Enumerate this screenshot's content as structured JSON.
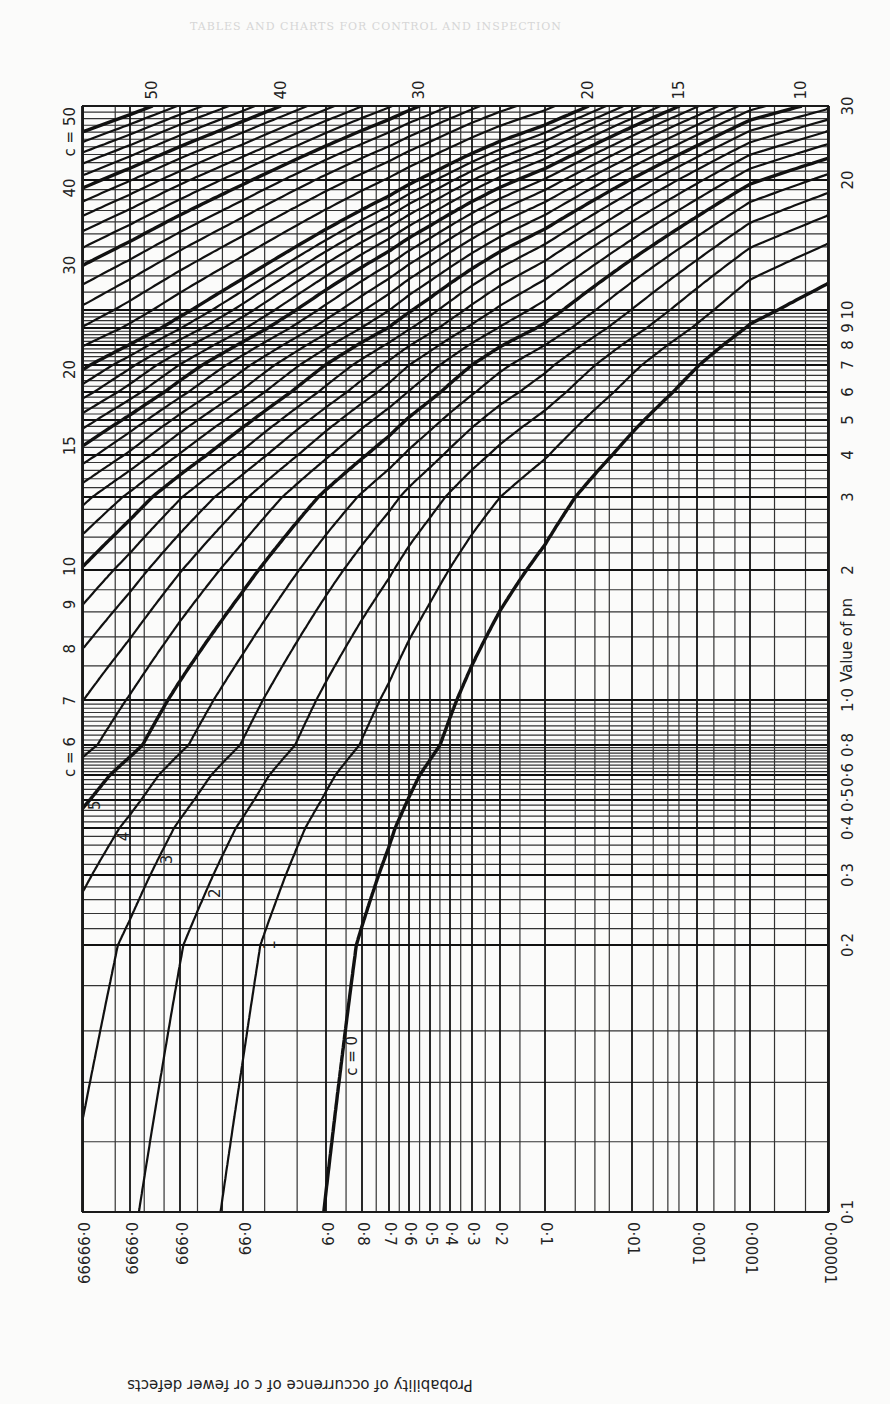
{
  "page": {
    "faint_header": "TABLES AND CHARTS FOR CONTROL AND INSPECTION"
  },
  "chart_data": {
    "type": "line",
    "title": "",
    "xlabel": "Value of pn",
    "ylabel": "Probability of occurrence of c or fewer defects",
    "orientation": "rotated 90 degrees clockwise (pn axis runs vertically along right edge, probability axis along bottom)",
    "x_scale": "log",
    "y_scale": "normal-probability",
    "xlim": [
      0.1,
      30
    ],
    "ylim": [
      1e-05,
      0.99999
    ],
    "grid": true,
    "x_ticks": [
      "0·1",
      "0·2",
      "0·3",
      "0·4",
      "0·5",
      "0·6",
      "0·8",
      "1·0",
      "2",
      "3",
      "4",
      "5",
      "6",
      "7",
      "8",
      "9",
      "10",
      "20",
      "30"
    ],
    "x_tick_values": [
      0.1,
      0.2,
      0.3,
      0.4,
      0.5,
      0.6,
      0.8,
      1.0,
      2,
      3,
      4,
      5,
      6,
      7,
      8,
      9,
      10,
      20,
      30
    ],
    "y_ticks": [
      "0·99999",
      "0·9999",
      "0·999",
      "0·99",
      "0·9",
      "0·8",
      "0·7",
      "0·6",
      "0·5",
      "0·4",
      "0·3",
      "0·2",
      "0·1",
      "0·01",
      "0·001",
      "0·0001",
      "0·00001"
    ],
    "y_tick_values": [
      0.99999,
      0.9999,
      0.999,
      0.99,
      0.9,
      0.8,
      0.7,
      0.6,
      0.5,
      0.4,
      0.3,
      0.2,
      0.1,
      0.01,
      0.001,
      0.0001,
      1e-05
    ],
    "series_description": "Cumulative Poisson probability P(X <= c) vs pn for each c",
    "series_c_values": [
      0,
      1,
      2,
      3,
      4,
      5,
      6,
      7,
      8,
      9,
      10,
      11,
      12,
      13,
      14,
      15,
      16,
      17,
      18,
      19,
      20,
      22,
      24,
      26,
      28,
      30,
      32,
      34,
      36,
      38,
      40,
      42,
      44,
      46,
      48,
      50
    ],
    "heavy_curves": [
      0,
      5,
      10,
      15,
      20,
      30,
      40,
      50
    ],
    "curve_labels_inside": [
      {
        "text": "c = 0",
        "c": 0
      },
      {
        "text": "1",
        "c": 1
      },
      {
        "text": "2",
        "c": 2
      },
      {
        "text": "3",
        "c": 3
      },
      {
        "text": "4",
        "c": 4
      },
      {
        "text": "5",
        "c": 5
      }
    ],
    "curve_labels_left_edge": [
      {
        "text": "c = 6",
        "c": 6
      },
      {
        "text": "7",
        "c": 7
      },
      {
        "text": "8",
        "c": 8
      },
      {
        "text": "9",
        "c": 9
      },
      {
        "text": "10",
        "c": 10
      },
      {
        "text": "15",
        "c": 15
      },
      {
        "text": "20",
        "c": 20
      },
      {
        "text": "30",
        "c": 30
      },
      {
        "text": "40",
        "c": 40
      },
      {
        "text": "c = 50",
        "c": 50
      }
    ],
    "curve_labels_top_edge": [
      {
        "text": "50",
        "c": 50
      },
      {
        "text": "40",
        "c": 40
      },
      {
        "text": "30",
        "c": 30
      },
      {
        "text": "20",
        "c": 20
      },
      {
        "text": "15",
        "c": 15
      },
      {
        "text": "10",
        "c": 10
      }
    ],
    "sample_points": [
      {
        "c": 0,
        "pn": 0.1,
        "p": 0.905
      },
      {
        "c": 0,
        "pn": 1.0,
        "p": 0.368
      },
      {
        "c": 0,
        "pn": 5,
        "p": 0.0067
      },
      {
        "c": 1,
        "pn": 1.0,
        "p": 0.736
      },
      {
        "c": 2,
        "pn": 1.0,
        "p": 0.92
      },
      {
        "c": 5,
        "pn": 5,
        "p": 0.616
      },
      {
        "c": 10,
        "pn": 10,
        "p": 0.583
      },
      {
        "c": 20,
        "pn": 20,
        "p": 0.559
      }
    ]
  }
}
